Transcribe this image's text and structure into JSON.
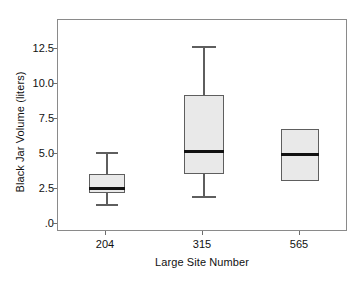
{
  "chart_data": {
    "type": "box",
    "title": "",
    "xlabel": "Large Site Number",
    "ylabel": "Black Jar Volume (liters)",
    "categories": [
      "204",
      "315",
      "565"
    ],
    "ylim": [
      0.0,
      14.3
    ],
    "yticks": [
      0.0,
      2.5,
      5.0,
      7.5,
      10.0,
      12.5
    ],
    "ytick_labels": [
      ".0",
      "2.5",
      "5.0",
      "7.5",
      "10.0",
      "12.5"
    ],
    "grid": false,
    "legend": false,
    "boxes": [
      {
        "category": "204",
        "whisker_low": 1.45,
        "q1": 2.2,
        "median": 2.55,
        "q3": 3.6,
        "whisker_high": 5.15
      },
      {
        "category": "315",
        "whisker_low": 2.0,
        "q1": 3.6,
        "median": 5.2,
        "q3": 9.2,
        "whisker_high": 12.75
      },
      {
        "category": "565",
        "whisker_low": 3.05,
        "q1": 3.05,
        "median": 5.0,
        "q3": 6.8,
        "whisker_high": 6.8
      }
    ],
    "colors": {
      "box_fill": "#e9e9e9",
      "box_edge": "#5e5e5e",
      "median": "#111111",
      "frame": "#8a8a8a",
      "text": "#111111",
      "background": "#ffffff"
    }
  }
}
